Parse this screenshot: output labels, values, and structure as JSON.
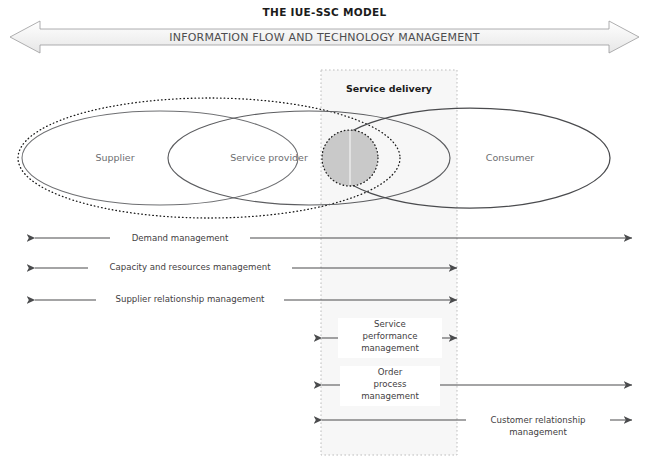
{
  "header": {
    "title": "THE IUE-SSC MODEL",
    "banner_label": "INFORMATION FLOW AND TECHNOLOGY MANAGEMENT"
  },
  "diagram": {
    "service_delivery_label": "Service delivery",
    "entities": [
      {
        "name": "supplier",
        "label": "Supplier"
      },
      {
        "name": "service-provider",
        "label": "Service provider"
      },
      {
        "name": "consumer",
        "label": "Consumer"
      }
    ],
    "flows": [
      {
        "name": "demand-management",
        "label": "Demand management",
        "direction": "both",
        "from_x": 35,
        "to_x": 632,
        "y": 238
      },
      {
        "name": "capacity-and-resources-management",
        "label": "Capacity and resources management",
        "direction": "both",
        "from_x": 35,
        "to_x": 457,
        "y": 268
      },
      {
        "name": "supplier-relationship-management",
        "label": "Supplier relationship management",
        "direction": "both",
        "from_x": 35,
        "to_x": 457,
        "y": 300
      },
      {
        "name": "service-performance-management",
        "label": "Service\nperformance\nmanagement",
        "direction": "both",
        "from_x": 322,
        "to_x": 457,
        "y": 338
      },
      {
        "name": "order-process-management",
        "label": "Order\nprocess\nmanagement",
        "direction": "both",
        "from_x": 322,
        "to_x": 632,
        "y": 385
      },
      {
        "name": "customer-relationship-management",
        "label": "Customer relationship\nmanagement",
        "direction": "both",
        "from_x": 322,
        "to_x": 632,
        "y": 420
      }
    ]
  },
  "colors": {
    "stroke": "#58585a",
    "text": "#3f4042",
    "banner_fill": "#f2f2f2",
    "service_delivery_fill": "#f7f7f7",
    "highlight_fill": "#c9c9c9",
    "dashed_stroke": "#b3b3b3"
  }
}
